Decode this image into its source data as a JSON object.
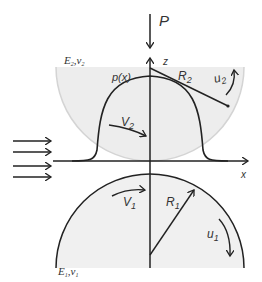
{
  "diagram": {
    "type": "elastohydrodynamic contact schematic",
    "labels": {
      "load": "P",
      "z_axis": "z",
      "x_axis": "x",
      "pressure": "p(x)",
      "upper_radius": "R",
      "upper_radius_sub": "2",
      "upper_surface_speed": "u",
      "upper_surface_speed_sub": "2",
      "upper_velocity": "V",
      "upper_velocity_sub": "2",
      "lower_radius": "R",
      "lower_radius_sub": "1",
      "lower_surface_speed": "u",
      "lower_surface_speed_sub": "1",
      "lower_velocity": "V",
      "lower_velocity_sub": "1",
      "upper_material": "E",
      "upper_material_sub": "2",
      "upper_material_nu": "ν",
      "upper_material_nu_sub": "2",
      "lower_material": "E",
      "lower_material_sub": "1",
      "lower_material_nu": "ν",
      "lower_material_nu_sub": "1"
    },
    "inflow_arrows": 4,
    "colors": {
      "line": "#222222",
      "body_fill": "#ececec",
      "body_edge": "#cfcfcf"
    }
  }
}
